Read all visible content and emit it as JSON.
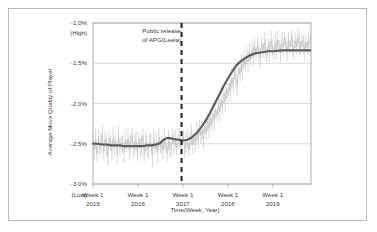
{
  "chart_data": {
    "type": "line",
    "title": "",
    "xlabel": "Time(Week, Year)",
    "ylabel": "Average Move Quality of Player",
    "ylim": [
      -3.0,
      -1.0
    ],
    "yticks": [
      -1.0,
      -1.5,
      -2.0,
      -2.5,
      -3.0
    ],
    "ytick_labels": [
      "-1,0%",
      "-1,5%",
      "-2,0%",
      "-2,5%",
      "-3,0%"
    ],
    "y_high_label": "(High)",
    "y_low_label": "(Low)",
    "grid": true,
    "legend": "none",
    "xticks": [
      2015,
      2016,
      2017,
      2018,
      2019
    ],
    "xtick_labels_line1": [
      "Week 1",
      "Week 1",
      "Week 1",
      "Week 1",
      "Week 1"
    ],
    "xtick_labels_line2": [
      "2015",
      "2016",
      "2017",
      "2018",
      "2019"
    ],
    "xlim": [
      2015.0,
      2019.85
    ],
    "annotations": [
      {
        "name": "public-release-marker",
        "line1": "Public release",
        "line2": "of APG(Leela)",
        "x": 2016.97,
        "style": "dashed-vertical-line",
        "color": "#1f1f1f"
      }
    ],
    "series": [
      {
        "name": "Weekly average move quality (raw)",
        "type": "line",
        "color": "#c6c6c6",
        "x": [
          2015.0,
          2015.03,
          2015.06,
          2015.09,
          2015.12,
          2015.15,
          2015.18,
          2015.21,
          2015.24,
          2015.27,
          2015.3,
          2015.33,
          2015.36,
          2015.39,
          2015.42,
          2015.45,
          2015.48,
          2015.51,
          2015.54,
          2015.57,
          2015.6,
          2015.63,
          2015.66,
          2015.69,
          2015.72,
          2015.75,
          2015.78,
          2015.81,
          2015.84,
          2015.87,
          2015.9,
          2015.93,
          2015.96,
          2015.99,
          2016.02,
          2016.05,
          2016.08,
          2016.11,
          2016.14,
          2016.17,
          2016.2,
          2016.23,
          2016.26,
          2016.29,
          2016.32,
          2016.35,
          2016.38,
          2016.41,
          2016.44,
          2016.47,
          2016.5,
          2016.53,
          2016.56,
          2016.59,
          2016.62,
          2016.65,
          2016.68,
          2016.71,
          2016.74,
          2016.77,
          2016.8,
          2016.83,
          2016.86,
          2016.89,
          2016.92,
          2016.95,
          2016.98,
          2017.01,
          2017.04,
          2017.07,
          2017.1,
          2017.13,
          2017.16,
          2017.19,
          2017.22,
          2017.25,
          2017.28,
          2017.31,
          2017.34,
          2017.37,
          2017.4,
          2017.43,
          2017.46,
          2017.49,
          2017.52,
          2017.55,
          2017.58,
          2017.61,
          2017.64,
          2017.67,
          2017.7,
          2017.73,
          2017.76,
          2017.79,
          2017.82,
          2017.85,
          2017.88,
          2017.91,
          2017.94,
          2017.97,
          2018.0,
          2018.03,
          2018.06,
          2018.09,
          2018.12,
          2018.15,
          2018.18,
          2018.21,
          2018.24,
          2018.27,
          2018.3,
          2018.33,
          2018.36,
          2018.39,
          2018.42,
          2018.45,
          2018.48,
          2018.51,
          2018.54,
          2018.57,
          2018.6,
          2018.63,
          2018.66,
          2018.69,
          2018.72,
          2018.75,
          2018.78,
          2018.81,
          2018.84,
          2018.87,
          2018.9,
          2018.93,
          2018.96,
          2018.99,
          2019.02,
          2019.05,
          2019.08,
          2019.11,
          2019.14,
          2019.17,
          2019.2,
          2019.23,
          2019.26,
          2019.29,
          2019.32,
          2019.35,
          2019.38,
          2019.41,
          2019.44,
          2019.47,
          2019.5,
          2019.53,
          2019.56,
          2019.59,
          2019.62,
          2019.65,
          2019.68,
          2019.71,
          2019.74,
          2019.77,
          2019.8,
          2019.83
        ],
        "y": [
          -2.46,
          -2.58,
          -2.44,
          -2.62,
          -2.41,
          -2.55,
          -2.49,
          -2.38,
          -2.6,
          -2.44,
          -2.52,
          -2.65,
          -2.43,
          -2.5,
          -2.59,
          -2.42,
          -2.54,
          -2.47,
          -2.63,
          -2.4,
          -2.56,
          -2.48,
          -2.51,
          -2.61,
          -2.45,
          -2.53,
          -2.43,
          -2.58,
          -2.49,
          -2.39,
          -2.57,
          -2.5,
          -2.46,
          -2.62,
          -2.44,
          -2.55,
          -2.52,
          -2.41,
          -2.64,
          -2.47,
          -2.53,
          -2.59,
          -2.45,
          -2.5,
          -2.66,
          -2.43,
          -2.56,
          -2.48,
          -2.61,
          -2.42,
          -2.54,
          -2.51,
          -2.58,
          -2.44,
          -2.49,
          -2.63,
          -2.46,
          -2.52,
          -2.57,
          -2.41,
          -2.5,
          -2.45,
          -2.55,
          -2.48,
          -2.43,
          -2.53,
          -2.47,
          -2.41,
          -2.56,
          -2.5,
          -2.44,
          -2.58,
          -2.46,
          -2.39,
          -2.52,
          -2.43,
          -2.48,
          -2.35,
          -2.45,
          -2.3,
          -2.4,
          -2.33,
          -2.44,
          -2.28,
          -2.36,
          -2.22,
          -2.31,
          -2.18,
          -2.26,
          -2.12,
          -2.2,
          -2.08,
          -2.15,
          -2.02,
          -2.1,
          -1.95,
          -2.05,
          -1.88,
          -1.97,
          -1.82,
          -1.9,
          -1.75,
          -1.84,
          -1.68,
          -1.77,
          -1.6,
          -1.7,
          -1.78,
          -1.55,
          -1.64,
          -1.5,
          -1.58,
          -1.44,
          -1.52,
          -1.4,
          -1.48,
          -1.36,
          -1.45,
          -1.33,
          -1.41,
          -1.3,
          -1.38,
          -1.28,
          -1.36,
          -1.43,
          -1.26,
          -1.34,
          -1.24,
          -1.32,
          -1.4,
          -1.27,
          -1.35,
          -1.22,
          -1.3,
          -1.38,
          -1.25,
          -1.33,
          -1.21,
          -1.29,
          -1.37,
          -1.24,
          -1.31,
          -1.2,
          -1.28,
          -1.35,
          -1.23,
          -1.3,
          -1.19,
          -1.27,
          -1.34,
          -1.22,
          -1.29,
          -1.18,
          -1.26,
          -1.33,
          -1.21,
          -1.28,
          -1.35,
          -1.24,
          -1.31,
          -1.2,
          -1.27
        ]
      },
      {
        "name": "Smoothed trend",
        "type": "line",
        "color": "#5b5b5b",
        "x": [
          2015.0,
          2015.1,
          2015.2,
          2015.3,
          2015.4,
          2015.5,
          2015.6,
          2015.7,
          2015.8,
          2015.9,
          2016.0,
          2016.1,
          2016.2,
          2016.3,
          2016.4,
          2016.5,
          2016.55,
          2016.6,
          2016.65,
          2016.7,
          2016.8,
          2016.9,
          2017.0,
          2017.1,
          2017.2,
          2017.3,
          2017.4,
          2017.5,
          2017.6,
          2017.7,
          2017.8,
          2017.9,
          2018.0,
          2018.1,
          2018.2,
          2018.3,
          2018.4,
          2018.5,
          2018.6,
          2018.7,
          2018.8,
          2018.9,
          2019.0,
          2019.2,
          2019.4,
          2019.6,
          2019.83
        ],
        "y": [
          -2.5,
          -2.5,
          -2.51,
          -2.51,
          -2.52,
          -2.52,
          -2.52,
          -2.53,
          -2.53,
          -2.53,
          -2.53,
          -2.53,
          -2.52,
          -2.52,
          -2.51,
          -2.49,
          -2.46,
          -2.44,
          -2.43,
          -2.43,
          -2.44,
          -2.45,
          -2.46,
          -2.45,
          -2.42,
          -2.37,
          -2.3,
          -2.22,
          -2.12,
          -2.01,
          -1.9,
          -1.79,
          -1.69,
          -1.6,
          -1.52,
          -1.47,
          -1.43,
          -1.4,
          -1.38,
          -1.37,
          -1.36,
          -1.35,
          -1.35,
          -1.34,
          -1.34,
          -1.34,
          -1.34
        ]
      }
    ]
  },
  "colors": {
    "raw_series": "#c6c6c6",
    "trend_series": "#5b5b5b",
    "gridline": "#c9c9c9",
    "axis": "#9a9a9a",
    "annotation_line": "#1f1f1f",
    "frame": "#b9b9b9",
    "text": "#3a3a3a",
    "background": "#ffffff"
  }
}
